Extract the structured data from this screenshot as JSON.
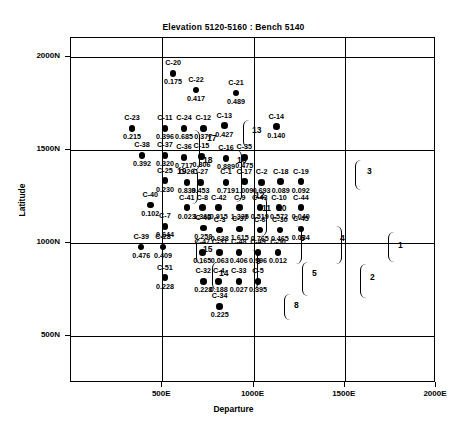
{
  "chart_data": {
    "type": "scatter",
    "title": "Elevation 5120-5160 : Bench 5140",
    "xlabel": "Departure",
    "ylabel": "Latitude",
    "xlim": [
      0,
      2000
    ],
    "ylim": [
      250,
      2100
    ],
    "xticks": [
      "500E",
      "1000E",
      "1500E",
      "2000E"
    ],
    "xtick_values": [
      500,
      1000,
      1500,
      2000
    ],
    "yticks": [
      "2000N",
      "1500N",
      "1000N",
      "500N"
    ],
    "ytick_values": [
      2000,
      1500,
      1000,
      500
    ],
    "grid": true,
    "legend": "none",
    "point_label_format": "name above marker, value below marker",
    "points": [
      {
        "name": "C-20",
        "value": "0.175",
        "x": 565,
        "y": 1905
      },
      {
        "name": "C-22",
        "value": "0.417",
        "x": 690,
        "y": 1815
      },
      {
        "name": "C-21",
        "value": "0.489",
        "x": 910,
        "y": 1800
      },
      {
        "name": "C-23",
        "value": "0.215",
        "x": 340,
        "y": 1610
      },
      {
        "name": "C-11",
        "value": "0.396",
        "x": 520,
        "y": 1610
      },
      {
        "name": "C-24",
        "value": "0.685",
        "x": 625,
        "y": 1610
      },
      {
        "name": "C-12",
        "value": "0.377",
        "x": 730,
        "y": 1610
      },
      {
        "name": "C-13",
        "value": "0.427",
        "x": 845,
        "y": 1625
      },
      {
        "name": "C-14",
        "value": "0.140",
        "x": 1130,
        "y": 1620
      },
      {
        "name": "C-38",
        "value": "0.392",
        "x": 395,
        "y": 1465
      },
      {
        "name": "C-37",
        "value": "0.320",
        "x": 520,
        "y": 1465
      },
      {
        "name": "C-36",
        "value": "0.717",
        "x": 625,
        "y": 1455
      },
      {
        "name": "C-15",
        "value": "0.806",
        "x": 720,
        "y": 1460
      },
      {
        "name": "C-16",
        "value": "0.889",
        "x": 855,
        "y": 1450
      },
      {
        "name": "C-35",
        "value": "0.475",
        "x": 955,
        "y": 1455
      },
      {
        "name": "C-25",
        "value": "0.230",
        "x": 520,
        "y": 1330
      },
      {
        "name": "C-26",
        "value": "0.839",
        "x": 640,
        "y": 1320
      },
      {
        "name": "C-27",
        "value": "0.453",
        "x": 715,
        "y": 1320
      },
      {
        "name": "C-1",
        "value": "0.719",
        "x": 855,
        "y": 1320
      },
      {
        "name": "C-17",
        "value": "1.009",
        "x": 955,
        "y": 1325
      },
      {
        "name": "C-2",
        "value": "0.693",
        "x": 1050,
        "y": 1320
      },
      {
        "name": "C-18",
        "value": "0.089",
        "x": 1155,
        "y": 1325
      },
      {
        "name": "C-19",
        "value": "0.092",
        "x": 1265,
        "y": 1325
      },
      {
        "name": "C-40",
        "value": "0.102",
        "x": 440,
        "y": 1200
      },
      {
        "name": "C-41",
        "value": "0.023",
        "x": 640,
        "y": 1185
      },
      {
        "name": "C-8",
        "value": "1.365",
        "x": 725,
        "y": 1185
      },
      {
        "name": "C-42",
        "value": "0.915",
        "x": 815,
        "y": 1185
      },
      {
        "name": "C-9",
        "value": "1.335",
        "x": 930,
        "y": 1185
      },
      {
        "name": "C-43",
        "value": "0.519",
        "x": 1040,
        "y": 1185
      },
      {
        "name": "C-10",
        "value": "0.572",
        "x": 1145,
        "y": 1185
      },
      {
        "name": "C-44",
        "value": "0.040",
        "x": 1265,
        "y": 1185
      },
      {
        "name": "C-7",
        "value": "0.644",
        "x": 520,
        "y": 1085
      },
      {
        "name": "C-46",
        "value": "0.258",
        "x": 730,
        "y": 1075
      },
      {
        "name": "C-3",
        "value": "0.638",
        "x": 820,
        "y": 1065
      },
      {
        "name": "C-37",
        "value": "1.615",
        "x": 930,
        "y": 1070
      },
      {
        "name": "C-6",
        "value": "0.765",
        "x": 1040,
        "y": 1065
      },
      {
        "name": "C-30",
        "value": "0.465",
        "x": 1150,
        "y": 1065
      },
      {
        "name": "C-45",
        "value": "0.034",
        "x": 1265,
        "y": 1070
      },
      {
        "name": "C-39",
        "value": "0.476",
        "x": 390,
        "y": 975
      },
      {
        "name": "C-28",
        "value": "0.409",
        "x": 510,
        "y": 975
      },
      {
        "name": "C-47",
        "value": "0.165",
        "x": 725,
        "y": 945
      },
      {
        "name": "C-31",
        "value": "0.063",
        "x": 820,
        "y": 945
      },
      {
        "name": "C-48",
        "value": "0.406",
        "x": 925,
        "y": 945
      },
      {
        "name": "C-49",
        "value": "0.996",
        "x": 1030,
        "y": 945
      },
      {
        "name": "C-50",
        "value": "0.012",
        "x": 1140,
        "y": 945
      },
      {
        "name": "C-51",
        "value": "0.228",
        "x": 520,
        "y": 810
      },
      {
        "name": "C-32",
        "value": "0.228",
        "x": 730,
        "y": 790
      },
      {
        "name": "C-4",
        "value": "0.188",
        "x": 815,
        "y": 790
      },
      {
        "name": "C-33",
        "value": "0.027",
        "x": 925,
        "y": 790
      },
      {
        "name": "C-5",
        "value": "0.395",
        "x": 1030,
        "y": 790
      },
      {
        "name": "C-34",
        "value": "0.225",
        "x": 820,
        "y": 655
      }
    ],
    "cluster_ids": [
      {
        "label": "17",
        "x": 207,
        "y": 133
      },
      {
        "label": "13",
        "x": 252,
        "y": 125
      },
      {
        "label": "19",
        "x": 177,
        "y": 166
      },
      {
        "label": "18",
        "x": 203,
        "y": 155
      },
      {
        "label": "16",
        "x": 237,
        "y": 155
      },
      {
        "label": "3",
        "x": 367,
        "y": 166
      },
      {
        "label": "11",
        "x": 262,
        "y": 203
      },
      {
        "label": "10",
        "x": 277,
        "y": 203
      },
      {
        "label": "12",
        "x": 255,
        "y": 190
      },
      {
        "label": "15",
        "x": 203,
        "y": 244
      },
      {
        "label": "6",
        "x": 300,
        "y": 233
      },
      {
        "label": "4",
        "x": 340,
        "y": 233
      },
      {
        "label": "1",
        "x": 398,
        "y": 240
      },
      {
        "label": "14",
        "x": 219,
        "y": 268
      },
      {
        "label": "9",
        "x": 256,
        "y": 256
      },
      {
        "label": "5",
        "x": 312,
        "y": 268
      },
      {
        "label": "2",
        "x": 370,
        "y": 272
      },
      {
        "label": "8",
        "x": 294,
        "y": 300
      }
    ]
  }
}
